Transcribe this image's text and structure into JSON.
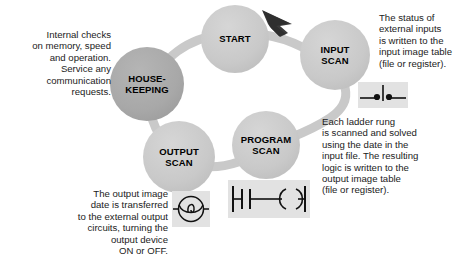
{
  "diagram": {
    "background_color": "#ffffff",
    "node_fill": "#c9c9c9",
    "node_fill_dark": "#a8a8a8",
    "band_color": "#c9c9c9",
    "arrow_color": "#3a3a3a"
  },
  "nodes": {
    "housekeeping": {
      "label": "HOUSE-\nKEEPING"
    },
    "start": {
      "label": "START"
    },
    "input_scan": {
      "label": "INPUT\nSCAN"
    },
    "program_scan": {
      "label": "PROGRAM\nSCAN"
    },
    "output_scan": {
      "label": "OUTPUT\nSCAN"
    }
  },
  "notes": {
    "housekeeping": "Internal checks\non memory, speed\nand operation.\nService any\ncommunication\nrequests.",
    "input_scan": "The status of\nexternal inputs\nis written to the\ninput image table\n(file or register).",
    "program_scan": "Each ladder rung\nis scanned and solved\nusing the date in the\ninput file. The resulting\nlogic is written to the\noutput image table\n(file or register).",
    "output_scan": "The output image\ndate is transferred\nto the external output\ncircuits, turning the\noutput device\nON or OFF."
  },
  "symbols": {
    "input_switch": {
      "name": "limit-switch-symbol"
    },
    "output_lamp": {
      "name": "pilot-lamp-symbol"
    },
    "ladder_rung": {
      "name": "ladder-rung-symbol"
    }
  }
}
